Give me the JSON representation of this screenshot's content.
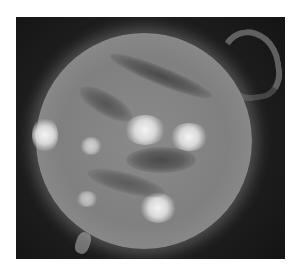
{
  "image": {
    "subject": "sun",
    "description": "Grayscale extreme-ultraviolet image of the Sun showing bright active regions, dark filaments, and a large looping prominence on the upper-right limb",
    "colors": {
      "background": "#ffffff",
      "sky": "#1c1c1c",
      "disk": "#858585",
      "active_region": "#f0f0f0",
      "filament": "#4a4a4a"
    },
    "features": [
      {
        "type": "active-region",
        "label": "bright region left limb"
      },
      {
        "type": "active-region",
        "label": "bright region center"
      },
      {
        "type": "active-region",
        "label": "bright region center-right"
      },
      {
        "type": "active-region",
        "label": "bright region lower center"
      },
      {
        "type": "filament",
        "label": "dark filament upper"
      },
      {
        "type": "filament",
        "label": "dark filament center"
      },
      {
        "type": "prominence",
        "label": "loop prominence upper right"
      }
    ]
  }
}
